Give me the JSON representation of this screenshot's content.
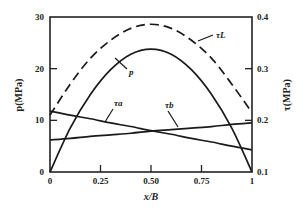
{
  "chart_data": {
    "type": "line",
    "title": "",
    "xlabel": "x/B",
    "ylabel": "p(MPa)",
    "ylabel_right": "τ(MPa)",
    "xlim": [
      0,
      1
    ],
    "ylim": [
      0,
      30
    ],
    "ylim_right": [
      0.1,
      0.4
    ],
    "x_ticks": [
      "0",
      "0.25",
      "0.50",
      "0.75",
      "1"
    ],
    "y_ticks": [
      "0",
      "10",
      "20",
      "30"
    ],
    "y_ticks_right": [
      "0.1",
      "0.2",
      "0.3",
      "0.4"
    ],
    "grid": false,
    "legend": "inline curve labels",
    "x": [
      0,
      0.1,
      0.2,
      0.3,
      0.4,
      0.5,
      0.6,
      0.7,
      0.8,
      0.9,
      1.0
    ],
    "series": [
      {
        "name": "p",
        "axis": "left",
        "style": "solid",
        "values": [
          0,
          8.5,
          15.0,
          19.8,
          22.8,
          23.8,
          22.8,
          19.8,
          15.0,
          8.5,
          0
        ]
      },
      {
        "name": "τL",
        "axis": "right",
        "style": "dashed",
        "values": [
          0.21,
          0.27,
          0.32,
          0.355,
          0.378,
          0.386,
          0.378,
          0.355,
          0.32,
          0.27,
          0.215
        ]
      },
      {
        "name": "τa",
        "axis": "right",
        "style": "solid",
        "values": [
          0.218,
          0.21,
          0.203,
          0.195,
          0.188,
          0.18,
          0.173,
          0.165,
          0.158,
          0.15,
          0.143
        ]
      },
      {
        "name": "τb",
        "axis": "right",
        "style": "solid",
        "values": [
          0.162,
          0.165,
          0.169,
          0.172,
          0.175,
          0.179,
          0.182,
          0.185,
          0.188,
          0.192,
          0.195
        ]
      }
    ]
  },
  "labels": {
    "x_axis_title": "x/B",
    "y_axis_left_title": "p(MPa)",
    "y_axis_right_title": "τ(MPa)",
    "curve_p": "p",
    "curve_tauL": "τL",
    "curve_taua": "τa",
    "curve_taub": "τb"
  }
}
